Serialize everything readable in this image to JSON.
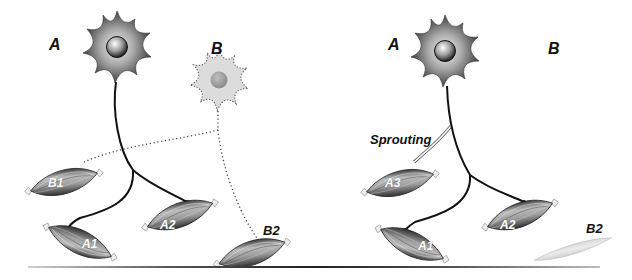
{
  "figure": {
    "type": "diagram",
    "topic": "motor neuron denervation and collateral sprouting",
    "bottom_rule": true
  },
  "left_panel": {
    "neuron_labels": {
      "a": "A",
      "b": "B"
    },
    "neuron_a": {
      "state": "intact",
      "color": "#555555"
    },
    "neuron_b": {
      "state": "degenerating",
      "color": "#d9d9d9",
      "nucleus_color": "#9a9a9a",
      "outline": "dotted"
    },
    "muscle_fibers": [
      {
        "label": "B1",
        "innervated_by": "B"
      },
      {
        "label": "A1",
        "innervated_by": "A"
      },
      {
        "label": "A2",
        "innervated_by": "A"
      },
      {
        "label": "B2",
        "innervated_by": "B"
      }
    ]
  },
  "right_panel": {
    "neuron_labels": {
      "a": "A",
      "b": "B"
    },
    "neuron_a": {
      "state": "intact",
      "color": "#555555"
    },
    "annotation": "Sprouting",
    "muscle_fibers": [
      {
        "label": "A3",
        "innervated_by": "A (sprout)"
      },
      {
        "label": "A1",
        "innervated_by": "A"
      },
      {
        "label": "A2",
        "innervated_by": "A"
      },
      {
        "label": "B2",
        "innervated_by": "none",
        "state": "atrophied"
      }
    ]
  },
  "colors": {
    "axon": "#111111",
    "dotted_axon": "#444444",
    "muscle_dark": "#6e6e6e",
    "muscle_light": "#bdbdbd",
    "atrophied_muscle": "#e3e3e3",
    "tendon": "#eeeeee"
  }
}
